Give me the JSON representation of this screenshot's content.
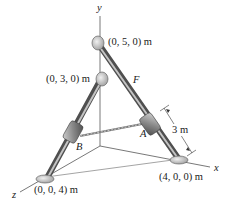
{
  "figure": {
    "axes": {
      "x_label": "x",
      "y_label": "y",
      "z_label": "z"
    },
    "points": {
      "top_support": "(0, 5, 0) m",
      "mid_support": "(0, 3, 0) m",
      "x_support": "(4, 0, 0) m",
      "z_support": "(0, 0, 4) m"
    },
    "collars": {
      "a_label": "A",
      "b_label": "B"
    },
    "force_label": "F",
    "dimension_label": "3 m",
    "colors": {
      "rod": "#6f6f6f",
      "rod_highlight": "#bdbdbd",
      "collar": "#8a8a8a",
      "axis_line": "#555555",
      "text": "#1a1a1a"
    }
  }
}
